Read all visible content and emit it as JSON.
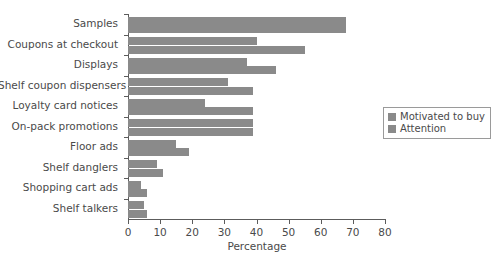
{
  "chart_data": {
    "type": "bar",
    "orientation": "horizontal",
    "title": "",
    "xlabel": "Percentage",
    "ylabel": "",
    "xlim": [
      0,
      80
    ],
    "xticks": [
      0,
      10,
      20,
      30,
      40,
      50,
      60,
      70,
      80
    ],
    "grid": false,
    "legend_position": "right",
    "categories": [
      "Samples",
      "Coupons at checkout",
      "Displays",
      "Shelf coupon dispensers",
      "Loyalty card notices",
      "On-pack promotions",
      "Floor ads",
      "Shelf danglers",
      "Shopping cart ads",
      "Shelf talkers"
    ],
    "series": [
      {
        "name": "Motivated to buy",
        "color": "#8a8a8a",
        "values": [
          68,
          40,
          37,
          31,
          24,
          39,
          15,
          9,
          4,
          5
        ]
      },
      {
        "name": "Attention",
        "color": "#8a8a8a",
        "values": [
          68,
          55,
          46,
          39,
          39,
          39,
          19,
          11,
          6,
          6
        ]
      }
    ]
  },
  "legend": {
    "items": [
      {
        "label": "Motivated to buy",
        "color": "#8a8a8a"
      },
      {
        "label": "Attention",
        "color": "#8a8a8a"
      }
    ]
  },
  "axis": {
    "x_title": "Percentage"
  },
  "caption": {
    "text": ""
  }
}
